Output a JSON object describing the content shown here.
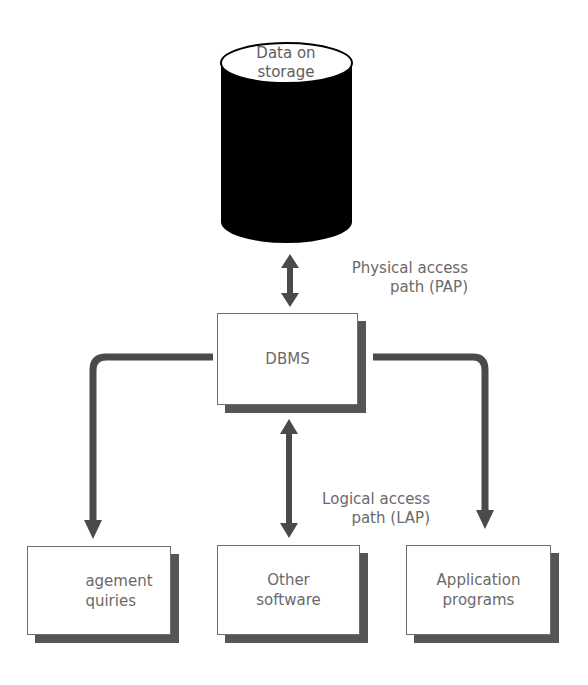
{
  "storage": {
    "label_line1": "Data on",
    "label_line2": "storage"
  },
  "dbms": {
    "label": "DBMS"
  },
  "physical_path": {
    "line1": "Physical access",
    "line2": "path (PAP)"
  },
  "logical_path": {
    "line1": "Logical access",
    "line2": "path (LAP)"
  },
  "targets": [
    {
      "line1": "agement",
      "line2": "quiries"
    },
    {
      "line1": "Other",
      "line2": "software"
    },
    {
      "line1": "Application",
      "line2": "programs"
    }
  ],
  "colors": {
    "cylinder": "#000000",
    "arrow": "#4a4a4a",
    "text": "#6a6a6a",
    "shadow": "#555555"
  }
}
